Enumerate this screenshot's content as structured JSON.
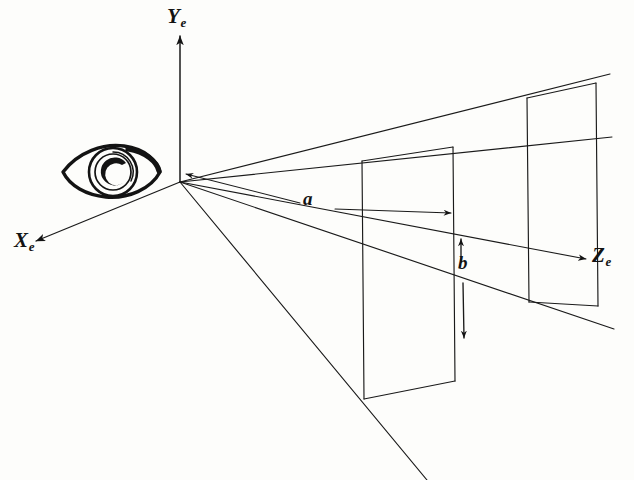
{
  "figure": {
    "background_color": "#fdfdfb",
    "ink_color": "#131313",
    "line_color": "#1a1a1a"
  },
  "axes": [
    {
      "name": "x-axis",
      "label_base": "X",
      "label_sub": "e",
      "description": "Eye-space X axis, arrow pointing down-left",
      "origin": [
        180,
        182
      ],
      "tip": [
        32,
        243
      ]
    },
    {
      "name": "y-axis",
      "label_base": "Y",
      "label_sub": "e",
      "description": "Eye-space Y axis, arrow pointing up",
      "origin": [
        180,
        182
      ],
      "tip": [
        180,
        34
      ]
    },
    {
      "name": "z-axis",
      "label_base": "Z",
      "label_sub": "e",
      "description": "Eye-space Z axis, arrow pointing right into the scene",
      "origin": [
        180,
        182
      ],
      "tip": [
        588,
        259
      ]
    }
  ],
  "eye": {
    "name": "eye-symbol",
    "description": "Hand-drawn eye with iris and pupil, positioned left of the origin looking toward +Z",
    "center": [
      108,
      172
    ]
  },
  "origin": {
    "name": "viewpoint-origin",
    "label": "",
    "point": [
      180,
      182
    ]
  },
  "near_plane": {
    "name": "near-clipping-plane",
    "corners": [
      [
        362,
        161
      ],
      [
        453,
        147
      ],
      [
        455,
        381
      ],
      [
        364,
        399
      ]
    ]
  },
  "far_plane": {
    "name": "far-clipping-plane",
    "corners": [
      [
        527,
        98
      ],
      [
        596,
        83
      ],
      [
        598,
        306
      ],
      [
        529,
        302
      ]
    ]
  },
  "frustum_rays": [
    {
      "name": "ray-top-left",
      "from": [
        180,
        182
      ],
      "to": [
        610,
        74
      ]
    },
    {
      "name": "ray-top-right",
      "from": [
        180,
        182
      ],
      "to": [
        612,
        137
      ]
    },
    {
      "name": "ray-bottom-right",
      "from": [
        180,
        182
      ],
      "to": [
        614,
        329
      ]
    },
    {
      "name": "ray-bottom-left",
      "from": [
        180,
        182
      ],
      "to": [
        427,
        480
      ]
    }
  ],
  "dimensions": [
    {
      "name": "dimension-a",
      "label": "a",
      "kind": "double-headed-arrow",
      "orientation": "horizontal",
      "from": [
        181,
        173
      ],
      "to": [
        455,
        213
      ],
      "meaning": "distance from the viewpoint to the far plane along the view direction"
    },
    {
      "name": "dimension-b",
      "label": "b",
      "kind": "double-headed-arrow",
      "orientation": "vertical",
      "from": [
        461,
        236
      ],
      "to": [
        464,
        342
      ],
      "meaning": "half-height of the view volume measured on the far plane"
    }
  ]
}
